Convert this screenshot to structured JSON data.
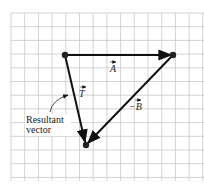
{
  "diagram": {
    "grid": {
      "x0": 11,
      "y0": 13,
      "x1": 204,
      "y1": 181,
      "cell": 13.7,
      "color": "#c8c8c8"
    },
    "points": {
      "P1": [
        65,
        55
      ],
      "P2": [
        173,
        55
      ],
      "P3": [
        86,
        145
      ]
    },
    "vectors": [
      {
        "name": "A",
        "label": "A",
        "from": "P1",
        "to": "P2"
      },
      {
        "name": "neg-B",
        "label": "−B",
        "from": "P2",
        "to": "P3"
      },
      {
        "name": "T",
        "label": "T",
        "from": "P1",
        "to": "P3"
      }
    ],
    "annotation": {
      "line1": "Resultant",
      "line2": "vector"
    },
    "colors": {
      "vector": "#111111",
      "dot": "#222222"
    }
  }
}
